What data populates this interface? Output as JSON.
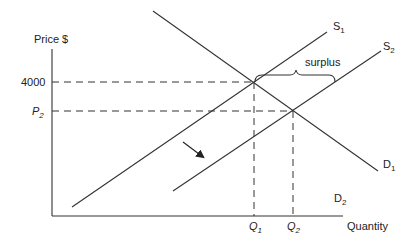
{
  "diagram": {
    "type": "supply-demand",
    "axes": {
      "y_label": "Price $",
      "x_label": "Quantity"
    },
    "price_levels": [
      {
        "label": "4000",
        "italic": false
      },
      {
        "label": "P",
        "subscript": "2",
        "italic": true
      }
    ],
    "quantity_levels": [
      {
        "label": "Q",
        "subscript": "1"
      },
      {
        "label": "Q",
        "subscript": "2"
      }
    ],
    "curves": [
      {
        "name": "S",
        "subscript": "1",
        "kind": "supply"
      },
      {
        "name": "S",
        "subscript": "2",
        "kind": "supply"
      },
      {
        "name": "D",
        "subscript": "1",
        "kind": "demand"
      },
      {
        "name": "D",
        "subscript": "2",
        "kind": "demand"
      }
    ],
    "annotations": {
      "surplus_label": "surplus",
      "shift_arrow": "supply shifts right"
    },
    "colors": {
      "line": "#333333",
      "background": "#ffffff"
    }
  }
}
